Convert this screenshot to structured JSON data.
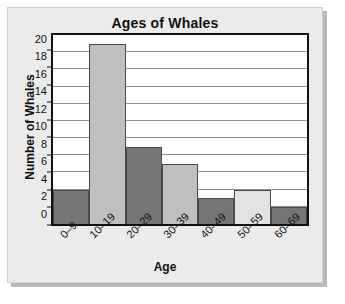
{
  "chart_data": {
    "type": "bar",
    "title": "Ages of Whales",
    "xlabel": "Age",
    "ylabel": "Number of Whales",
    "categories": [
      "0–9",
      "10–19",
      "20–29",
      "30–39",
      "40–49",
      "50–59",
      "60–69"
    ],
    "values": [
      4,
      21,
      9,
      7,
      3,
      4,
      2
    ],
    "bar_colors": [
      "#767676",
      "#bfbfbf",
      "#767676",
      "#bfbfbf",
      "#767676",
      "#e2e2e2",
      "#767676"
    ],
    "ylim": [
      0,
      22
    ],
    "yticks": [
      0,
      2,
      4,
      6,
      8,
      10,
      12,
      14,
      16,
      18,
      20
    ],
    "ytick_labels": [
      "0",
      "2",
      "4",
      "6",
      "8",
      "10",
      "12",
      "14",
      "16",
      "18",
      "20"
    ],
    "grid": true,
    "grid_color": "#8f8f8f",
    "legend": null,
    "xtick_rotation": -45,
    "plot_background": "#ffffff",
    "axis_color": "#111111"
  },
  "panel": {
    "background": "#ebebeb",
    "border_color": "#cfcfcf",
    "shadow_color": "#b9b9b9"
  }
}
